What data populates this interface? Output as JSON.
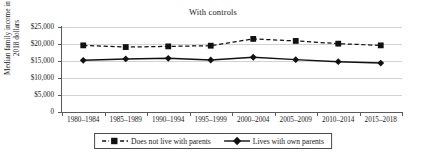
{
  "chart_data": {
    "type": "line",
    "title": "With controls",
    "xlabel": "",
    "ylabel": "Median family income in 2018 dollars",
    "categories": [
      "1980–1984",
      "1985–1989",
      "1990–1994",
      "1995–1999",
      "2000–2004",
      "2005–2009",
      "2010–2014",
      "2015–2018"
    ],
    "ylim": [
      0,
      25000
    ],
    "ytick_values": [
      25000,
      20000,
      15000,
      10000,
      5000,
      0
    ],
    "ytick_labels": [
      "$25,000",
      "$20,000",
      "$15,000",
      "$10,000",
      "$5,000",
      "0"
    ],
    "grid": true,
    "legend_position": "bottom-center",
    "series": [
      {
        "name": "Does not live with parents",
        "values": [
          19600,
          19100,
          19300,
          19500,
          21500,
          20900,
          20100,
          19600
        ],
        "line_style": "dashed",
        "marker": "square",
        "color": "#111111"
      },
      {
        "name": "Lives with own parents",
        "values": [
          15200,
          15600,
          15800,
          15300,
          16100,
          15400,
          14800,
          14400
        ],
        "line_style": "solid",
        "marker": "diamond",
        "color": "#111111"
      }
    ]
  },
  "legend": {
    "entries": [
      {
        "label": "Does not live with parents"
      },
      {
        "label": "Lives with own parents"
      }
    ]
  },
  "colors": {
    "series": "#111111",
    "axis": "#5a5a5a",
    "grid": "#d2d2d2",
    "text": "#1a1a1a",
    "background": "#ffffff"
  }
}
